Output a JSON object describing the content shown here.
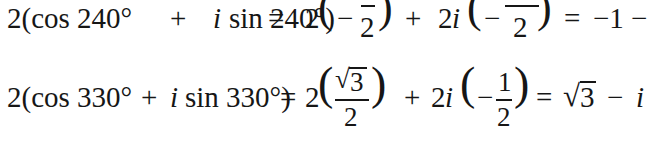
{
  "equations": [
    {
      "lhs_coeff": "2(cos 240°",
      "plus": "+",
      "imag_unit": "i",
      "sin_part": "sin 240°)",
      "equals": "=",
      "term1_coeff": "2",
      "term1_sign": "−",
      "term1_num": "1",
      "term1_den": "2",
      "op": "+",
      "term2_coeff": "2",
      "term2_unit": "i",
      "term2_sign": "−",
      "term2_num": "√3",
      "term2_den": "2",
      "equals2": "=",
      "result": "−1 −",
      "result_tail": "√3 i"
    },
    {
      "lhs_coeff": "2(cos 330°",
      "plus": "+",
      "imag_unit": "i",
      "sin_part": "sin 330°)",
      "equals": "=",
      "term1_coeff": "2",
      "term1_num_root": "√",
      "term1_num_val": "3",
      "term1_den": "2",
      "op": "+",
      "term2_coeff": "2",
      "term2_unit": "i",
      "term2_sign": "−",
      "term2_num": "1",
      "term2_den": "2",
      "equals2": "=",
      "result_root": "√",
      "result_val": "3",
      "result_minus": "−",
      "result_unit": "i"
    }
  ]
}
